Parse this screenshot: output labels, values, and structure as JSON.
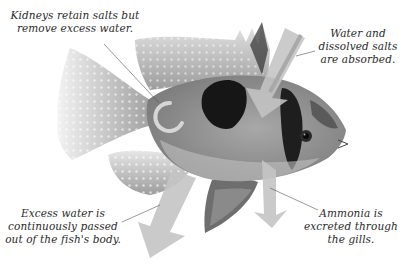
{
  "figure": {
    "style": "grayscale photo illustration with translucent arrows",
    "colors": {
      "background": "#ffffff",
      "arrow": "#c8c8c8",
      "text": "#2a2a2a",
      "leader_line": "#555555",
      "fish_dark_patch": "#1a1a1a",
      "fish_body": "#9a9a9a"
    }
  },
  "labels": {
    "kidneys": {
      "line1": "Kidneys retain salts but",
      "line2": "remove excess water."
    },
    "water_in": {
      "line1": "Water and",
      "line2": "dissolved salts",
      "line3": "are absorbed."
    },
    "excess_water": {
      "line1": "Excess water is",
      "line2": "continuously passed",
      "line3": "out of the fish's body."
    },
    "ammonia": {
      "line1": "Ammonia is",
      "line2": "excreted through",
      "line3": "the gills."
    }
  },
  "arrows": [
    {
      "name": "water-in-arrow",
      "direction": "down-left into head"
    },
    {
      "name": "excess-water-arrow",
      "direction": "down-left out of body"
    },
    {
      "name": "ammonia-arrow",
      "direction": "down out of gills"
    },
    {
      "name": "kidney-cycle-arrow",
      "direction": "circular"
    }
  ]
}
